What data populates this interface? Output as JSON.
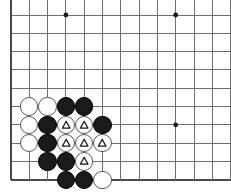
{
  "figure": {
    "kind": "go-board-diagram",
    "title": "Go board corner position",
    "width": 231,
    "height": 193,
    "background_color": "#ffffff"
  },
  "board": {
    "line_color": "#6e6e6e",
    "edge_line_color": "#4a4a4a",
    "line_width": 1,
    "edge_line_width": 1.6,
    "spacing": 18.3,
    "origin_x": 11,
    "origin_y": 15,
    "cols": 13,
    "rows": 10,
    "edges": {
      "left": true,
      "bottom": true,
      "top": false,
      "right": false
    },
    "star_points": [
      {
        "col": 3,
        "row": 0,
        "x": 65.9,
        "y": 15
      },
      {
        "col": 9,
        "row": 0,
        "x": 175.7,
        "y": 15
      },
      {
        "col": 9,
        "row": 6,
        "x": 175.7,
        "y": 124.8
      }
    ],
    "star_point_radius": 2.4,
    "star_point_color": "#1a1a1a"
  },
  "stones": {
    "radius": 9.2,
    "black_color": "#1a1a1a",
    "white_color": "#ffffff",
    "white_border_color": "#5a5a5a",
    "triangle_color": "#1a1a1a",
    "list": [
      {
        "id": "w-c1-r5",
        "color": "white",
        "mark": "none",
        "col": 1,
        "row": 5,
        "x": 29.3,
        "y": 106.5
      },
      {
        "id": "w-c2-r5",
        "color": "white",
        "mark": "none",
        "col": 2,
        "row": 5,
        "x": 47.6,
        "y": 106.5
      },
      {
        "id": "b-c3-r5",
        "color": "black",
        "mark": "none",
        "col": 3,
        "row": 5,
        "x": 65.9,
        "y": 106.5
      },
      {
        "id": "b-c4-r5",
        "color": "black",
        "mark": "none",
        "col": 4,
        "row": 5,
        "x": 84.2,
        "y": 106.5
      },
      {
        "id": "w-c1-r6",
        "color": "white",
        "mark": "none",
        "col": 1,
        "row": 6,
        "x": 29.3,
        "y": 124.8
      },
      {
        "id": "b-c2-r6",
        "color": "black",
        "mark": "none",
        "col": 2,
        "row": 6,
        "x": 47.6,
        "y": 124.8
      },
      {
        "id": "w-c3-r6",
        "color": "white",
        "mark": "triangle",
        "col": 3,
        "row": 6,
        "x": 65.9,
        "y": 124.8
      },
      {
        "id": "w-c4-r6",
        "color": "white",
        "mark": "triangle",
        "col": 4,
        "row": 6,
        "x": 84.2,
        "y": 124.8
      },
      {
        "id": "b-c5-r6",
        "color": "black",
        "mark": "none",
        "col": 5,
        "row": 6,
        "x": 102.5,
        "y": 124.8
      },
      {
        "id": "w-c1-r7",
        "color": "white",
        "mark": "none",
        "col": 1,
        "row": 7,
        "x": 29.3,
        "y": 143.1
      },
      {
        "id": "b-c2-r7",
        "color": "black",
        "mark": "none",
        "col": 2,
        "row": 7,
        "x": 47.6,
        "y": 143.1
      },
      {
        "id": "w-c3-r7",
        "color": "white",
        "mark": "triangle",
        "col": 3,
        "row": 7,
        "x": 65.9,
        "y": 143.1
      },
      {
        "id": "w-c4-r7",
        "color": "white",
        "mark": "triangle",
        "col": 4,
        "row": 7,
        "x": 84.2,
        "y": 143.1
      },
      {
        "id": "w-c5-r7",
        "color": "white",
        "mark": "triangle",
        "col": 5,
        "row": 7,
        "x": 102.5,
        "y": 143.1
      },
      {
        "id": "b-c2-r8",
        "color": "black",
        "mark": "none",
        "col": 2,
        "row": 8,
        "x": 47.6,
        "y": 161.4
      },
      {
        "id": "b-c3-r8",
        "color": "black",
        "mark": "none",
        "col": 3,
        "row": 8,
        "x": 65.9,
        "y": 161.4
      },
      {
        "id": "w-c4-r8",
        "color": "white",
        "mark": "triangle",
        "col": 4,
        "row": 8,
        "x": 84.2,
        "y": 161.4
      },
      {
        "id": "b-c3-r9",
        "color": "black",
        "mark": "none",
        "col": 3,
        "row": 9,
        "x": 65.9,
        "y": 179.7
      },
      {
        "id": "b-c4-r9",
        "color": "black",
        "mark": "none",
        "col": 4,
        "row": 9,
        "x": 84.2,
        "y": 179.7
      },
      {
        "id": "w-c5-r9",
        "color": "white",
        "mark": "none",
        "col": 5,
        "row": 9,
        "x": 102.5,
        "y": 179.7
      }
    ]
  }
}
